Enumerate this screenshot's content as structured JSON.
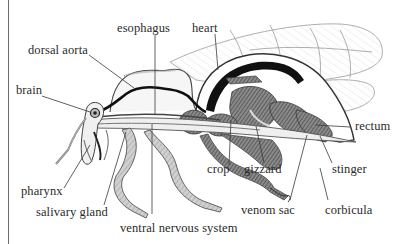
{
  "diagram": {
    "colors": {
      "ink": "#2a2a2a",
      "leader_line": "#3a3a3a",
      "organ_fill": "#6a6a6a",
      "dark_vessel": "#111111",
      "wing_line": "#9a9a9a",
      "background": "#ffffff"
    },
    "labels": [
      {
        "id": "esophagus",
        "text": "esophagus"
      },
      {
        "id": "heart",
        "text": "heart"
      },
      {
        "id": "dorsal-aorta",
        "text": "dorsal aorta"
      },
      {
        "id": "brain",
        "text": "brain"
      },
      {
        "id": "rectum",
        "text": "rectum"
      },
      {
        "id": "crop",
        "text": "crop"
      },
      {
        "id": "gizzard",
        "text": "gizzard"
      },
      {
        "id": "stinger",
        "text": "stinger"
      },
      {
        "id": "pharynx",
        "text": "pharynx"
      },
      {
        "id": "salivary-gland",
        "text": "salivary gland"
      },
      {
        "id": "venom-sac",
        "text": "venom sac"
      },
      {
        "id": "corbicula",
        "text": "corbicula"
      },
      {
        "id": "ventral-nervous-system",
        "text": "ventral nervous system"
      }
    ]
  }
}
